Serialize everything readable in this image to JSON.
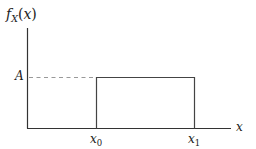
{
  "diagram": {
    "type": "uniform-pdf",
    "y_label": {
      "f": "f",
      "sub": "X",
      "open": "(",
      "arg": "x",
      "close": ")"
    },
    "x_label": "x",
    "level_label": "A",
    "tick_labels": [
      {
        "base": "x",
        "sub": "0"
      },
      {
        "base": "x",
        "sub": "1"
      }
    ],
    "colors": {
      "axis": "#333333",
      "box": "#444444",
      "dashed": "#999999",
      "text": "#222222"
    }
  }
}
